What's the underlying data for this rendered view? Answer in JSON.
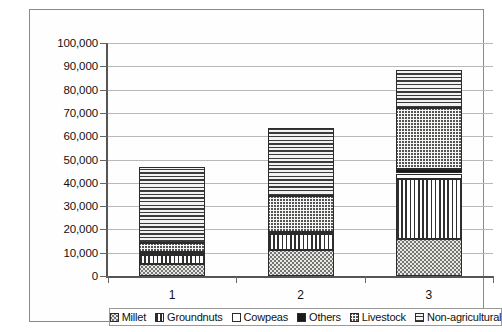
{
  "chart_data": {
    "type": "bar",
    "subtype": "stacked-bar",
    "title": "",
    "xlabel": "",
    "ylabel": "",
    "categories": [
      "1",
      "2",
      "3"
    ],
    "ylim": [
      0,
      100000
    ],
    "ytick_values": [
      0,
      10000,
      20000,
      30000,
      40000,
      50000,
      60000,
      70000,
      80000,
      90000,
      100000
    ],
    "ytick_labels": [
      "0",
      "10,000",
      "20,000",
      "30,000",
      "40,000",
      "50,000",
      "60,000",
      "70,000",
      "80,000",
      "90,000",
      "100,000"
    ],
    "grid": true,
    "legend_position": "bottom",
    "stack_order_bottom_to_top": [
      "Millet",
      "Groundnuts",
      "Cowpeas",
      "Others",
      "Livestock",
      "Non-agricultural"
    ],
    "series": [
      {
        "name": "Millet",
        "pattern": "stipple-dots",
        "values": [
          5000,
          11000,
          16000
        ]
      },
      {
        "name": "Groundnuts",
        "pattern": "vertical-stripes",
        "values": [
          4000,
          7000,
          25500
        ]
      },
      {
        "name": "Cowpeas",
        "pattern": "solid-white",
        "values": [
          600,
          500,
          2500
        ]
      },
      {
        "name": "Others",
        "pattern": "solid-black",
        "values": [
          700,
          400,
          2000
        ]
      },
      {
        "name": "Livestock",
        "pattern": "zigzag-crosshatch",
        "values": [
          3700,
          15600,
          26000
        ]
      },
      {
        "name": "Non-agricultural",
        "pattern": "horizontal-lines",
        "values": [
          32800,
          29200,
          16500
        ]
      }
    ],
    "totals": [
      46800,
      63700,
      88500
    ]
  },
  "legend": {
    "items": [
      {
        "label": "Millet"
      },
      {
        "label": "Groundnuts"
      },
      {
        "label": "Cowpeas"
      },
      {
        "label": "Others"
      },
      {
        "label": "Livestock"
      },
      {
        "label": "Non-agricultural"
      }
    ]
  }
}
